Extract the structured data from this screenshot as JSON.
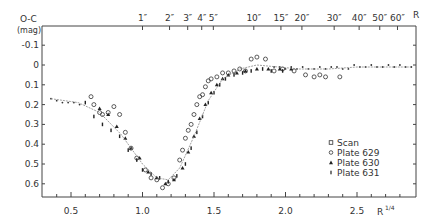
{
  "chart_data": {
    "type": "scatter",
    "title": "",
    "ylabel": "O-C",
    "ylabel_unit": "(mag)",
    "xlabel": "R^1/4",
    "top_xlabel": "R",
    "xlim": [
      0.3,
      2.9
    ],
    "ylim": [
      -0.15,
      0.72
    ],
    "y_inverted": true,
    "grid": false,
    "legend_position": "lower right",
    "x_ticks": [
      0.5,
      1.0,
      1.5,
      2.0,
      2.5
    ],
    "x_tick_labels": [
      "0.5",
      "1.0",
      "1.5",
      "2.0",
      "2.5"
    ],
    "y_ticks": [
      -0.1,
      0,
      0.1,
      0.2,
      0.3,
      0.4,
      0.5,
      0.6
    ],
    "y_tick_labels": [
      "-0.1",
      "0",
      "0.1",
      "0.2",
      "0.3",
      "0.4",
      "0.5",
      "0.6"
    ],
    "top_ticks": [
      {
        "r": 1,
        "label": "1″"
      },
      {
        "r": 2,
        "label": "2″"
      },
      {
        "r": 3,
        "label": "3″"
      },
      {
        "r": 4,
        "label": "4″"
      },
      {
        "r": 5,
        "label": "5″"
      },
      {
        "r": 10,
        "label": "10″"
      },
      {
        "r": 15,
        "label": "15″"
      },
      {
        "r": 20,
        "label": "20″"
      },
      {
        "r": 30,
        "label": "30″"
      },
      {
        "r": 40,
        "label": "40″"
      },
      {
        "r": 50,
        "label": "50″"
      },
      {
        "r": 60,
        "label": "60″"
      }
    ],
    "legend": [
      "Scan",
      "Plate 629",
      "Plate 630",
      "Plate 631"
    ],
    "series": [
      {
        "name": "Scan",
        "marker": "small-dot",
        "points": [
          [
            0.36,
            0.17
          ],
          [
            0.4,
            0.18
          ],
          [
            0.44,
            0.19
          ],
          [
            0.48,
            0.19
          ],
          [
            0.52,
            0.19
          ],
          [
            0.56,
            0.2
          ],
          [
            1.92,
            0.01
          ],
          [
            1.96,
            0.01
          ],
          [
            2.0,
            0.02
          ],
          [
            2.04,
            0.01
          ],
          [
            2.08,
            0.02
          ],
          [
            2.12,
            0.01
          ],
          [
            2.16,
            0.02
          ],
          [
            2.2,
            0.02
          ],
          [
            2.24,
            0.01
          ],
          [
            2.28,
            0.02
          ],
          [
            2.32,
            0.01
          ],
          [
            2.36,
            0.01
          ],
          [
            2.4,
            0.02
          ],
          [
            2.44,
            0.02
          ],
          [
            2.48,
            0.0
          ],
          [
            2.52,
            0.01
          ],
          [
            2.56,
            0.01
          ],
          [
            2.6,
            0.0
          ],
          [
            2.64,
            0.01
          ],
          [
            2.68,
            0.01
          ],
          [
            2.72,
            0.0
          ],
          [
            2.76,
            0.01
          ],
          [
            2.8,
            0.0
          ],
          [
            2.84,
            0.01
          ],
          [
            2.88,
            0.01
          ]
        ]
      },
      {
        "name": "Plate 629",
        "marker": "open-circle",
        "points": [
          [
            0.64,
            0.16
          ],
          [
            0.66,
            0.2
          ],
          [
            0.7,
            0.24
          ],
          [
            0.72,
            0.25
          ],
          [
            0.76,
            0.24
          ],
          [
            0.8,
            0.21
          ],
          [
            0.84,
            0.25
          ],
          [
            0.88,
            0.34
          ],
          [
            0.92,
            0.42
          ],
          [
            0.96,
            0.47
          ],
          [
            1.02,
            0.53
          ],
          [
            1.06,
            0.57
          ],
          [
            1.1,
            0.58
          ],
          [
            1.14,
            0.62
          ],
          [
            1.18,
            0.6
          ],
          [
            1.22,
            0.57
          ],
          [
            1.26,
            0.48
          ],
          [
            1.28,
            0.43
          ],
          [
            1.3,
            0.37
          ],
          [
            1.32,
            0.33
          ],
          [
            1.34,
            0.3
          ],
          [
            1.36,
            0.25
          ],
          [
            1.38,
            0.2
          ],
          [
            1.4,
            0.16
          ],
          [
            1.42,
            0.15
          ],
          [
            1.44,
            0.11
          ],
          [
            1.46,
            0.08
          ],
          [
            1.48,
            0.07
          ],
          [
            1.52,
            0.06
          ],
          [
            1.56,
            0.04
          ],
          [
            1.6,
            0.04
          ],
          [
            1.64,
            0.03
          ],
          [
            1.68,
            0.02
          ],
          [
            1.72,
            0.03
          ],
          [
            1.76,
            -0.03
          ],
          [
            1.8,
            -0.04
          ],
          [
            1.86,
            -0.03
          ],
          [
            1.92,
            0.03
          ],
          [
            1.98,
            0.02
          ],
          [
            2.06,
            0.03
          ],
          [
            2.14,
            0.05
          ],
          [
            2.2,
            0.06
          ],
          [
            2.24,
            0.05
          ],
          [
            2.28,
            0.06
          ],
          [
            2.38,
            0.06
          ]
        ]
      },
      {
        "name": "Plate 630",
        "marker": "filled-triangle",
        "points": [
          [
            0.7,
            0.22
          ],
          [
            0.76,
            0.25
          ],
          [
            0.82,
            0.31
          ],
          [
            0.88,
            0.37
          ],
          [
            0.92,
            0.42
          ],
          [
            0.98,
            0.47
          ],
          [
            1.04,
            0.54
          ],
          [
            1.1,
            0.57
          ],
          [
            1.16,
            0.6
          ],
          [
            1.22,
            0.58
          ],
          [
            1.28,
            0.52
          ],
          [
            1.32,
            0.44
          ],
          [
            1.36,
            0.36
          ],
          [
            1.4,
            0.27
          ],
          [
            1.44,
            0.2
          ],
          [
            1.48,
            0.14
          ],
          [
            1.52,
            0.1
          ],
          [
            1.56,
            0.07
          ],
          [
            1.6,
            0.05
          ],
          [
            1.66,
            0.04
          ],
          [
            1.72,
            0.03
          ],
          [
            1.8,
            0.02
          ],
          [
            1.88,
            0.02
          ],
          [
            1.96,
            0.02
          ],
          [
            2.04,
            0.02
          ]
        ]
      },
      {
        "name": "Plate 631",
        "marker": "plus-dot",
        "points": [
          [
            0.6,
            0.19
          ],
          [
            0.66,
            0.26
          ],
          [
            0.72,
            0.3
          ],
          [
            0.78,
            0.33
          ],
          [
            0.84,
            0.36
          ],
          [
            0.9,
            0.43
          ],
          [
            0.96,
            0.48
          ],
          [
            1.0,
            0.53
          ],
          [
            1.06,
            0.55
          ],
          [
            1.12,
            0.57
          ],
          [
            1.18,
            0.59
          ],
          [
            1.24,
            0.56
          ],
          [
            1.3,
            0.5
          ],
          [
            1.34,
            0.42
          ],
          [
            1.38,
            0.34
          ],
          [
            1.42,
            0.26
          ],
          [
            1.46,
            0.19
          ],
          [
            1.5,
            0.14
          ],
          [
            1.54,
            0.1
          ],
          [
            1.58,
            0.07
          ],
          [
            1.64,
            0.05
          ],
          [
            1.7,
            0.04
          ],
          [
            1.76,
            0.03
          ],
          [
            1.84,
            0.02
          ],
          [
            1.9,
            0.03
          ],
          [
            1.98,
            0.03
          ]
        ]
      },
      {
        "name": "Fit curve",
        "marker": "line",
        "points": [
          [
            0.36,
            0.17
          ],
          [
            0.55,
            0.19
          ],
          [
            0.7,
            0.24
          ],
          [
            0.85,
            0.35
          ],
          [
            1.0,
            0.5
          ],
          [
            1.1,
            0.57
          ],
          [
            1.18,
            0.58
          ],
          [
            1.26,
            0.52
          ],
          [
            1.36,
            0.36
          ],
          [
            1.46,
            0.18
          ],
          [
            1.56,
            0.07
          ],
          [
            1.68,
            0.02
          ],
          [
            1.8,
            0.0
          ],
          [
            1.95,
            0.01
          ],
          [
            2.1,
            0.02
          ],
          [
            2.3,
            0.02
          ],
          [
            2.5,
            0.01
          ],
          [
            2.7,
            0.01
          ],
          [
            2.88,
            0.01
          ]
        ]
      }
    ]
  }
}
